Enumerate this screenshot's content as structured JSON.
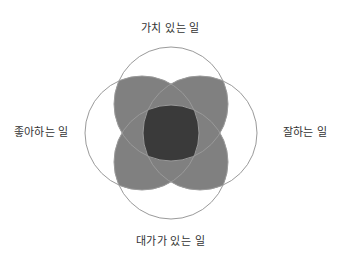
{
  "diagram": {
    "type": "venn-4-circle",
    "title_visible": false,
    "background_color": "#ffffff",
    "circle_stroke_color": "#9a9a9a",
    "circle_fill_color": "none",
    "pair_overlap_color": "#808080",
    "center_overlap_color": "#3a3a3a",
    "label_color": "#333333",
    "center": {
      "x": 171,
      "y": 133
    },
    "circle_radius": 57,
    "center_offset": 29,
    "circles": [
      {
        "id": "top",
        "label": "가치 있는 일",
        "cx": 171,
        "cy": 104
      },
      {
        "id": "right",
        "label": "잘하는 일",
        "cx": 200,
        "cy": 133
      },
      {
        "id": "bottom",
        "label": "대가가 있는 일",
        "cx": 171,
        "cy": 162
      },
      {
        "id": "left",
        "label": "좋아하는 일",
        "cx": 142,
        "cy": 133
      }
    ],
    "labels": {
      "top": "가치 있는 일",
      "right": "잘하는 일",
      "bottom": "대가가 있는 일",
      "left": "좋아하는 일"
    }
  }
}
